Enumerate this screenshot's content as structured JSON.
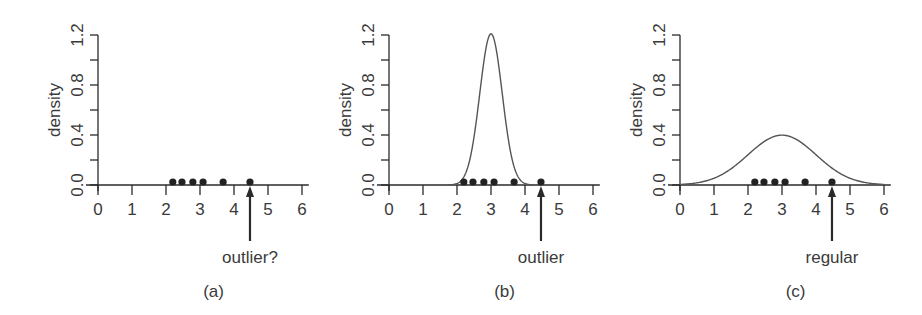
{
  "chart_data": [
    {
      "type": "scatter",
      "panel": "(a)",
      "caption": "(a)",
      "xlabel": "",
      "ylabel": "density",
      "xlim": [
        0,
        6
      ],
      "ylim": [
        0,
        1.2
      ],
      "x_ticks": [
        "0",
        "1",
        "2",
        "3",
        "4",
        "5",
        "6"
      ],
      "y_ticks": [
        "0.0",
        "0.4",
        "0.8",
        "1.2"
      ],
      "y_minor_ticks": [
        0.2,
        0.6,
        1.0
      ],
      "points_x": [
        2.2,
        2.47,
        2.79,
        3.09,
        3.68,
        4.47
      ],
      "density_curve": null,
      "annotation": {
        "text": "outlier?",
        "x": 4.47
      }
    },
    {
      "type": "line",
      "panel": "(b)",
      "caption": "(b)",
      "xlabel": "",
      "ylabel": "density",
      "xlim": [
        0,
        6
      ],
      "ylim": [
        0,
        1.2
      ],
      "x_ticks": [
        "0",
        "1",
        "2",
        "3",
        "4",
        "5",
        "6"
      ],
      "y_ticks": [
        "0.0",
        "0.4",
        "0.8",
        "1.2"
      ],
      "y_minor_ticks": [
        0.2,
        0.6,
        1.0
      ],
      "points_x": [
        2.2,
        2.47,
        2.79,
        3.09,
        3.68,
        4.47
      ],
      "density_curve": {
        "distribution": "normal",
        "mean": 3.0,
        "sd": 0.33,
        "peak": 1.2
      },
      "annotation": {
        "text": "outlier",
        "x": 4.47
      }
    },
    {
      "type": "line",
      "panel": "(c)",
      "caption": "(c)",
      "xlabel": "",
      "ylabel": "density",
      "xlim": [
        0,
        6
      ],
      "ylim": [
        0,
        1.2
      ],
      "x_ticks": [
        "0",
        "1",
        "2",
        "3",
        "4",
        "5",
        "6"
      ],
      "y_ticks": [
        "0.0",
        "0.4",
        "0.8",
        "1.2"
      ],
      "y_minor_ticks": [
        0.2,
        0.6,
        1.0
      ],
      "points_x": [
        2.2,
        2.47,
        2.79,
        3.09,
        3.68,
        4.47
      ],
      "density_curve": {
        "distribution": "normal",
        "mean": 3.0,
        "sd": 1.0,
        "peak": 0.4
      },
      "annotation": {
        "text": "regular",
        "x": 4.47
      }
    }
  ],
  "panels": [
    {
      "caption": "(a)",
      "ylabel": "density",
      "annotation": "outlier?"
    },
    {
      "caption": "(b)",
      "ylabel": "density",
      "annotation": "outlier"
    },
    {
      "caption": "(c)",
      "ylabel": "density",
      "annotation": "regular"
    }
  ],
  "colors": {
    "ink": "#2a2a2a",
    "curve": "#555555",
    "point": "#222222"
  }
}
